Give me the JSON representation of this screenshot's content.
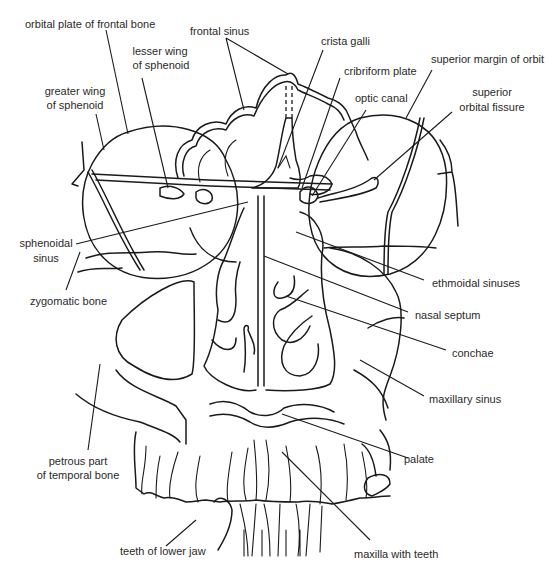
{
  "diagram": {
    "type": "anatomical line drawing",
    "colors": {
      "line": "#1a1a1a",
      "text": "#2a2a2a",
      "background": "#ffffff"
    },
    "labels": [
      {
        "id": "orbital-plate",
        "text": "orbital plate of frontal bone"
      },
      {
        "id": "frontal-sinus",
        "text": "frontal sinus"
      },
      {
        "id": "crista-galli",
        "text": "crista galli"
      },
      {
        "id": "lesser-wing-1",
        "text": "lesser wing"
      },
      {
        "id": "lesser-wing-2",
        "text": "of sphenoid"
      },
      {
        "id": "cribriform-plate",
        "text": "cribriform plate"
      },
      {
        "id": "superior-margin",
        "text": "superior margin of orbit"
      },
      {
        "id": "greater-wing-1",
        "text": "greater wing"
      },
      {
        "id": "greater-wing-2",
        "text": "of sphenoid"
      },
      {
        "id": "optic-canal",
        "text": "optic canal"
      },
      {
        "id": "sup-orbital-fissure-1",
        "text": "superior"
      },
      {
        "id": "sup-orbital-fissure-2",
        "text": "orbital fissure"
      },
      {
        "id": "sphenoidal-sinus-1",
        "text": "sphenoidal"
      },
      {
        "id": "sphenoidal-sinus-2",
        "text": "sinus"
      },
      {
        "id": "ethmoidal-sinuses",
        "text": "ethmoidal sinuses"
      },
      {
        "id": "zygomatic-bone",
        "text": "zygomatic bone"
      },
      {
        "id": "nasal-septum",
        "text": "nasal septum"
      },
      {
        "id": "conchae",
        "text": "conchae"
      },
      {
        "id": "maxillary-sinus",
        "text": "maxillary sinus"
      },
      {
        "id": "petrous-1",
        "text": "petrous part"
      },
      {
        "id": "petrous-2",
        "text": "of temporal bone"
      },
      {
        "id": "palate",
        "text": "palate"
      },
      {
        "id": "teeth-lower-jaw",
        "text": "teeth of lower jaw"
      },
      {
        "id": "maxilla-teeth",
        "text": "maxilla with teeth"
      }
    ]
  }
}
